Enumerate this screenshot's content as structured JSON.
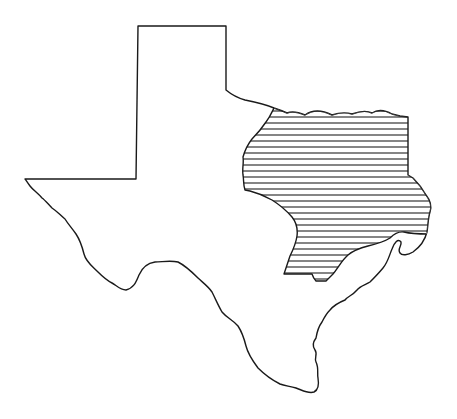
{
  "map": {
    "subject": "Texas state outline",
    "highlighted_region": {
      "name": "East Texas",
      "pattern": "horizontal-hatch",
      "hatch_spacing_px": 6
    },
    "colors": {
      "background": "#ffffff",
      "outline": "#1a1a1a",
      "hatch": "#333333"
    }
  }
}
